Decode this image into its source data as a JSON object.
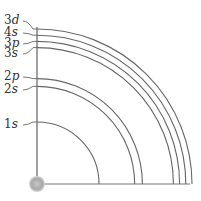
{
  "nucleus_label": "nucleus",
  "orbitals": [
    {
      "label": "1s",
      "num": "1",
      "letter": "s",
      "relative_radius": 0.4
    },
    {
      "label": "2s",
      "num": "2",
      "letter": "s",
      "relative_radius": 0.63
    },
    {
      "label": "2p",
      "num": "2",
      "letter": "p",
      "relative_radius": 0.68
    },
    {
      "label": "3s",
      "num": "3",
      "letter": "s",
      "relative_radius": 0.88
    },
    {
      "label": "3p",
      "num": "3",
      "letter": "p",
      "relative_radius": 0.92
    },
    {
      "label": "4s",
      "num": "4",
      "letter": "s",
      "relative_radius": 0.96
    },
    {
      "label": "3d",
      "num": "3",
      "letter": "d",
      "relative_radius": 1.0
    }
  ],
  "colors": {
    "arc": "#666666",
    "axis": "#444444",
    "nucleus": "#aaaaaa"
  }
}
